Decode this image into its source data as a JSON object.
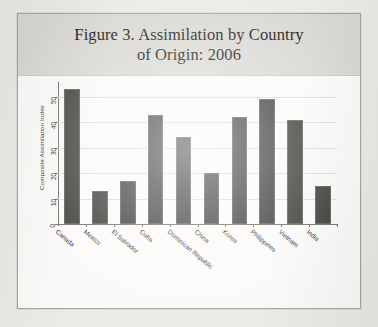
{
  "figure": {
    "title_line1": "Figure 3. Assimilation by Country",
    "title_line2": "of Origin: 2006",
    "border_color": "#a8a59f",
    "title_band_color": "#d9d7d2",
    "page_background": "#eceae6",
    "panel_background": "#fbfaf8"
  },
  "chart_data": {
    "type": "bar",
    "title": "Figure 3. Assimilation by Country of Origin: 2006",
    "xlabel": "",
    "ylabel": "Composite Assimilation Index",
    "categories": [
      "Canada",
      "Mexico",
      "El Salvador",
      "Cuba",
      "Dominican Republic",
      "China",
      "Korea",
      "Philippines",
      "Vietnam",
      "India"
    ],
    "values": [
      53,
      13,
      17,
      43,
      34,
      20,
      42,
      49,
      41,
      15
    ],
    "ylim": [
      0,
      55
    ],
    "yticks": [
      0,
      10,
      20,
      30,
      40,
      50
    ],
    "ytick_labels": [
      "0",
      "10",
      "20",
      "30",
      "40",
      "50"
    ],
    "grid": true,
    "legend": "none",
    "bar_color": "#3b3936",
    "grid_color": "#dedcd8",
    "axis_color": "#6f6c67"
  }
}
